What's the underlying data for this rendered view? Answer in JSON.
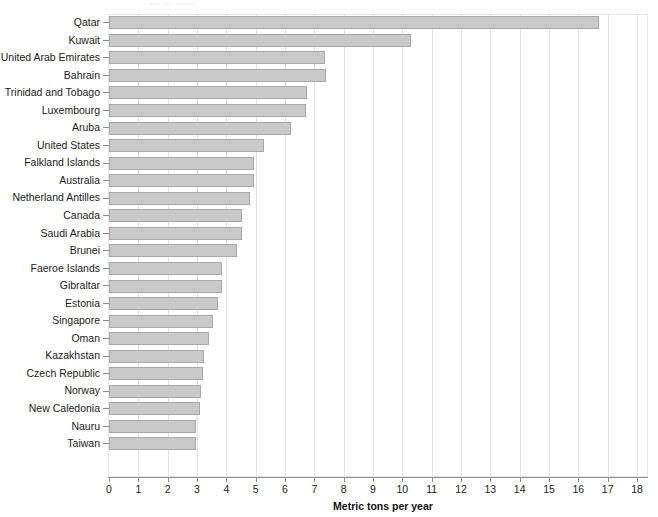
{
  "chart_data": {
    "type": "bar",
    "orientation": "horizontal",
    "title": "",
    "xlabel": "Metric tons per year",
    "ylabel": "",
    "xlim": [
      0,
      18
    ],
    "xticks": [
      0,
      1,
      2,
      3,
      4,
      5,
      6,
      7,
      8,
      9,
      10,
      11,
      12,
      13,
      14,
      15,
      16,
      17,
      18
    ],
    "grid": true,
    "legend": false,
    "bar_color": "#c9c9c9",
    "bar_border_color": "#a8a8a8",
    "categories": [
      "Qatar",
      "Kuwait",
      "United Arab Emirates",
      "Bahrain",
      "Trinidad and Tobago",
      "Luxembourg",
      "Aruba",
      "United States",
      "Falkland Islands",
      "Australia",
      "Netherland Antilles",
      "Canada",
      "Saudi Arabia",
      "Brunei",
      "Faeroe Islands",
      "Gibraltar",
      "Estonia",
      "Singapore",
      "Oman",
      "Kazakhstan",
      "Czech Republic",
      "Norway",
      "New Caledonia",
      "Nauru",
      "Taiwan"
    ],
    "values": [
      16.7,
      10.3,
      7.35,
      7.4,
      6.75,
      6.7,
      6.2,
      5.3,
      4.95,
      4.95,
      4.8,
      4.55,
      4.55,
      4.35,
      3.85,
      3.85,
      3.7,
      3.55,
      3.4,
      3.25,
      3.2,
      3.15,
      3.1,
      2.95,
      2.95
    ]
  },
  "top_clip_text": "···  ···  ······"
}
